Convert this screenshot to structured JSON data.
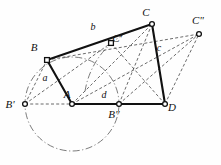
{
  "figure": {
    "type": "geometric-diagram",
    "width": 221,
    "height": 165,
    "background_color": "#fefefe",
    "stroke_color": "#111111",
    "dash_color": "#3a3a3a",
    "arc_color": "#5a5a5a",
    "vertex_fill": "#ffffff"
  },
  "points": [
    {
      "id": "A",
      "label": "A",
      "x": 72,
      "y": 104,
      "label_x": 67,
      "label_y": 98,
      "marker": "circle"
    },
    {
      "id": "B",
      "label": "B",
      "x": 47,
      "y": 60,
      "label_x": 34,
      "label_y": 51,
      "marker": "square"
    },
    {
      "id": "C",
      "label": "C",
      "x": 152,
      "y": 24,
      "label_x": 146,
      "label_y": 16,
      "marker": "circle"
    },
    {
      "id": "D",
      "label": "D",
      "x": 165,
      "y": 104,
      "label_x": 172,
      "label_y": 111,
      "marker": "circle"
    },
    {
      "id": "Bp",
      "label": "B'",
      "x": 25,
      "y": 104,
      "label_x": 10,
      "label_y": 108,
      "marker": "circle"
    },
    {
      "id": "Bpp",
      "label": "B\"",
      "x": 119,
      "y": 104,
      "label_x": 114,
      "label_y": 118,
      "marker": "circle"
    },
    {
      "id": "Cp",
      "label": "C'",
      "x": 111,
      "y": 43,
      "label_x": 117,
      "label_y": 42,
      "marker": "square"
    },
    {
      "id": "Cpp",
      "label": "C\"",
      "x": 199,
      "y": 34,
      "label_x": 198,
      "label_y": 24,
      "marker": "circle"
    }
  ],
  "side_labels": [
    {
      "id": "a",
      "label": "a",
      "x": 45,
      "y": 81,
      "describes": "segment B-A"
    },
    {
      "id": "b",
      "label": "b",
      "x": 93,
      "y": 30,
      "describes": "segment B-C"
    },
    {
      "id": "c",
      "label": "c",
      "x": 159,
      "y": 51,
      "describes": "segment C-D"
    },
    {
      "id": "d",
      "label": "d",
      "x": 104,
      "y": 98,
      "describes": "segment A-D"
    }
  ],
  "solid_edges": [
    {
      "id": "edge-a",
      "name": "B-A",
      "from": "B",
      "to": "A"
    },
    {
      "id": "edge-b",
      "name": "B-C",
      "from": "B",
      "to": "C"
    },
    {
      "id": "edge-c",
      "name": "C-D",
      "from": "C",
      "to": "D"
    },
    {
      "id": "edge-d",
      "name": "A-D",
      "from": "A",
      "to": "D"
    }
  ],
  "dashed_edges": [
    {
      "id": "dash-bp-b",
      "name": "B'-B",
      "from": "Bp",
      "to": "B"
    },
    {
      "id": "dash-b-cpp",
      "name": "B-C\"",
      "from": "B",
      "to": "Cpp"
    },
    {
      "id": "dash-bp-a",
      "name": "B'-A",
      "from": "Bp",
      "to": "A"
    },
    {
      "id": "dash-bp-cp",
      "name": "B'-C'",
      "from": "Bp",
      "to": "Cp"
    },
    {
      "id": "dash-a-c",
      "name": "A-C",
      "from": "A",
      "to": "C"
    },
    {
      "id": "dash-a-cpp",
      "name": "A-C\"",
      "from": "A",
      "to": "Cpp"
    },
    {
      "id": "dash-d-cp",
      "name": "D-C'",
      "from": "D",
      "to": "Cp"
    },
    {
      "id": "dash-d-cpp",
      "name": "D-C\"",
      "from": "D",
      "to": "Cpp"
    },
    {
      "id": "dash-bpp-c",
      "name": "B\"-C",
      "from": "Bpp",
      "to": "C"
    },
    {
      "id": "dash-bpp-cpp",
      "name": "B\"-C\"",
      "from": "Bpp",
      "to": "Cpp"
    }
  ],
  "arcs": [
    {
      "id": "circle-A",
      "name": "circle-centered-A",
      "center_x": 72,
      "center_y": 104,
      "radius": 47,
      "start_angle": 0,
      "end_angle": 360,
      "style": "dash-dot"
    },
    {
      "id": "arc-D",
      "name": "arc-centered-D",
      "center_x": 165,
      "center_y": 104,
      "radius": 81,
      "start_angle": 189,
      "end_angle": 242,
      "style": "dash-dot"
    }
  ]
}
